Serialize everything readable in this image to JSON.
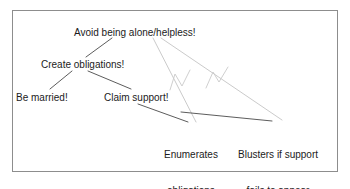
{
  "diagram": {
    "title_text": "Avoid being alone/helpless!",
    "frame": {
      "stroke": "#8d8d8d",
      "fill": "#ffffff"
    },
    "line_color": "#4a4a4a",
    "faint_line_color": "#bdbdbd",
    "text_color": "#1b1b1b",
    "nodes": [
      {
        "id": "root",
        "label": "Avoid being alone/helpless!",
        "x": 74,
        "y": 27
      },
      {
        "id": "obligations",
        "label": "Create obligations!",
        "x": 41,
        "y": 59
      },
      {
        "id": "married",
        "label": "Be married!",
        "x": 16,
        "y": 92
      },
      {
        "id": "claim",
        "label": "Claim support!",
        "x": 104,
        "y": 92
      },
      {
        "id": "enumerates",
        "label_line1": "Enumerates",
        "label_line2": "obligations",
        "x": 164,
        "y": 125
      },
      {
        "id": "blusters",
        "label_line1": "Blusters if support",
        "label_line2": "fails to appear",
        "x": 238,
        "y": 125
      }
    ],
    "edges": [
      {
        "from": "root",
        "to": "obligations",
        "style": "solid"
      },
      {
        "from": "obligations",
        "to": "married",
        "style": "solid"
      },
      {
        "from": "obligations",
        "to": "claim",
        "style": "solid"
      },
      {
        "from": "claim",
        "to": "enumerates",
        "style": "solid"
      },
      {
        "from": "enumerates",
        "to": "blusters",
        "style": "solid"
      },
      {
        "from": "root",
        "to": "enumerates",
        "style": "faint"
      },
      {
        "from": "root",
        "to": "blusters",
        "style": "faint"
      }
    ],
    "marks": [
      {
        "id": "zigzag-left",
        "kind": "zigzag"
      },
      {
        "id": "zigzag-right",
        "kind": "zigzag"
      }
    ]
  }
}
